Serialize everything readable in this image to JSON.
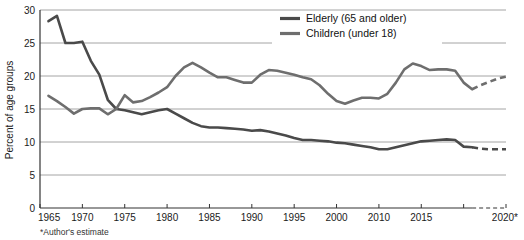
{
  "chart_data": {
    "type": "line",
    "title": "",
    "xlabel": "",
    "ylabel": "Percent of age groups",
    "xlim": [
      1965,
      2020
    ],
    "ylim": [
      0,
      30
    ],
    "grid": true,
    "legend_position": "top-center",
    "x_tick_labels": [
      "1965",
      "1970",
      "1975",
      "1980",
      "1985",
      "1990",
      "1995",
      "2000",
      "2010",
      "2015",
      "2020*"
    ],
    "x_tick_values": [
      1965,
      1970,
      1975,
      1980,
      1985,
      1990,
      1995,
      2000,
      2005,
      2010,
      2015
    ],
    "y_tick_labels": [
      "0",
      "5",
      "10",
      "15",
      "20",
      "25",
      "30"
    ],
    "y_tick_values": [
      0,
      5,
      10,
      15,
      20,
      25,
      30
    ],
    "footnote": "*Author's estimate",
    "series": [
      {
        "name": "Elderly (65 and older)",
        "legend_label": "Elderly (65 and older)",
        "color": "#4a4a4a",
        "style": "solid",
        "x": [
          1966,
          1967,
          1968,
          1969,
          1970,
          1971,
          1972,
          1973,
          1974,
          1975,
          1976,
          1977,
          1978,
          1979,
          1980,
          1981,
          1982,
          1983,
          1984,
          1985,
          1986,
          1987,
          1988,
          1989,
          1990,
          1991,
          1992,
          1993,
          1994,
          1995,
          1996,
          1997,
          1998,
          1999,
          2000,
          2001,
          2002,
          2003,
          2004,
          2005,
          2006,
          2007,
          2008,
          2009,
          2010,
          2011,
          2012,
          2013,
          2014,
          2015,
          2016
        ],
        "values": [
          28.3,
          29.1,
          25.0,
          25.0,
          25.2,
          22.3,
          20.2,
          16.4,
          15.0,
          14.8,
          14.5,
          14.2,
          14.5,
          14.8,
          15.0,
          14.3,
          13.6,
          12.9,
          12.4,
          12.2,
          12.2,
          12.1,
          12.0,
          11.9,
          11.7,
          11.8,
          11.6,
          11.3,
          11.0,
          10.6,
          10.3,
          10.3,
          10.2,
          10.1,
          9.9,
          9.8,
          9.6,
          9.4,
          9.2,
          8.9,
          8.9,
          9.2,
          9.5,
          9.8,
          10.1,
          10.2,
          10.3,
          10.4,
          10.3,
          9.3,
          9.2
        ],
        "projection_x": [
          2016,
          2017,
          2018,
          2019,
          2020
        ],
        "projection_values": [
          9.2,
          9.0,
          8.9,
          8.9,
          8.9
        ]
      },
      {
        "name": "Children (under 18)",
        "legend_label": "Children (under 18)",
        "color": "#6e6e6e",
        "style": "solid",
        "x": [
          1966,
          1967,
          1968,
          1969,
          1970,
          1971,
          1972,
          1973,
          1974,
          1975,
          1976,
          1977,
          1978,
          1979,
          1980,
          1981,
          1982,
          1983,
          1984,
          1985,
          1986,
          1987,
          1988,
          1989,
          1990,
          1991,
          1992,
          1993,
          1994,
          1995,
          1996,
          1997,
          1998,
          1999,
          2000,
          2001,
          2002,
          2003,
          2004,
          2005,
          2006,
          2007,
          2008,
          2009,
          2010,
          2011,
          2012,
          2013,
          2014,
          2015,
          2016
        ],
        "values": [
          17.0,
          16.2,
          15.3,
          14.3,
          15.0,
          15.1,
          15.1,
          14.2,
          15.0,
          17.1,
          16.0,
          16.2,
          16.8,
          17.5,
          18.3,
          20.0,
          21.3,
          22.0,
          21.3,
          20.5,
          19.8,
          19.8,
          19.4,
          19.0,
          19.0,
          20.2,
          20.9,
          20.8,
          20.5,
          20.2,
          19.8,
          19.5,
          18.6,
          17.3,
          16.2,
          15.8,
          16.3,
          16.7,
          16.7,
          16.6,
          17.3,
          19.0,
          21.0,
          21.9,
          21.5,
          20.9,
          21.0,
          21.0,
          20.8,
          19.0,
          18.0
        ],
        "projection_x": [
          2016,
          2017,
          2018,
          2019,
          2020
        ],
        "projection_values": [
          18.0,
          18.6,
          19.1,
          19.6,
          19.9
        ]
      }
    ]
  },
  "legend": {
    "items": [
      {
        "label": "Elderly (65 and older)",
        "color": "#4a4a4a"
      },
      {
        "label": "Children (under 18)",
        "color": "#6e6e6e"
      }
    ]
  },
  "footnote": {
    "text": "*Author's estimate"
  },
  "axes": {
    "y_title": "Percent of age groups"
  }
}
